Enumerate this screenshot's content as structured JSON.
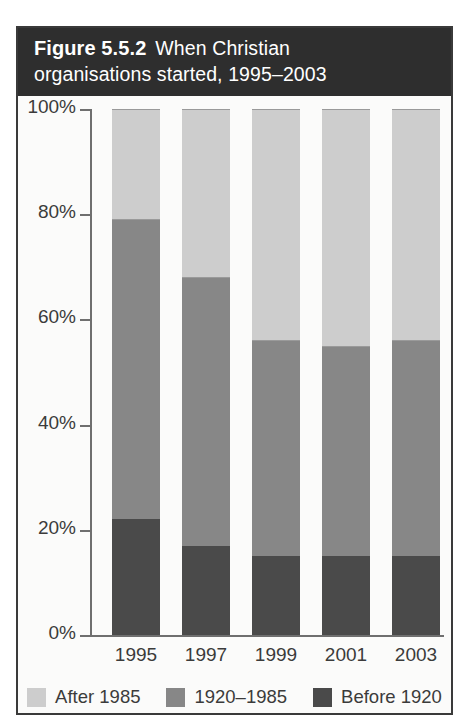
{
  "figure": {
    "number_label": "Figure 5.5.2",
    "caption": "When Christian organisations started, 1995–2003",
    "title_line1_prefix": "Figure 5.5.2",
    "title_line1_rest": "When Christian",
    "title_line2": "organisations started, 1995–2003"
  },
  "colors": {
    "after_1985": "#cdcdcd",
    "between_1920_1985": "#878787",
    "before_1920": "#4a4a4a",
    "title_band": "#2e2e2e",
    "frame_border": "#3a3a3a",
    "axis": "#6f6f6f",
    "text": "#3b3b3b",
    "background": "#fbfbfa"
  },
  "chart_data": {
    "type": "bar",
    "stacked": true,
    "normalized": true,
    "xlabel": "",
    "ylabel": "",
    "categories": [
      "1995",
      "1997",
      "1999",
      "2001",
      "2003"
    ],
    "ylim": [
      0,
      100
    ],
    "yticks": [
      0,
      20,
      40,
      60,
      80,
      100
    ],
    "ytick_labels": [
      "0%",
      "20%",
      "40%",
      "60%",
      "80%",
      "100%"
    ],
    "grid": false,
    "legend_position": "bottom",
    "series": [
      {
        "name": "Before 1920",
        "color": "#4a4a4a",
        "values": [
          22,
          17,
          15,
          15,
          15
        ]
      },
      {
        "name": "1920–1985",
        "color": "#878787",
        "values": [
          57,
          51,
          41,
          40,
          41
        ]
      },
      {
        "name": "After 1985",
        "color": "#cdcdcd",
        "values": [
          21,
          32,
          44,
          45,
          44
        ]
      }
    ],
    "cumulative_tops": {
      "before_1920": [
        22,
        17,
        15,
        15,
        15
      ],
      "through_1985": [
        79,
        68,
        56,
        55,
        56
      ],
      "total": [
        100,
        100,
        100,
        100,
        100
      ]
    }
  },
  "axis": {
    "y_tick_labels": [
      "100%",
      "80%",
      "60%",
      "40%",
      "20%",
      "0%"
    ],
    "y_tick_values": [
      100,
      80,
      60,
      40,
      20,
      0
    ],
    "x_tick_labels": [
      "1995",
      "1997",
      "1999",
      "2001",
      "2003"
    ]
  },
  "legend": {
    "items": [
      {
        "label": "After 1985",
        "color": "#cdcdcd"
      },
      {
        "label": "1920–1985",
        "color": "#878787"
      },
      {
        "label": "Before 1920",
        "color": "#4a4a4a"
      }
    ]
  }
}
